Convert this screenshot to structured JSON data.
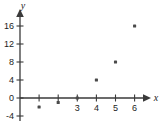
{
  "chart_data": {
    "type": "scatter",
    "title": "",
    "xlabel": "x",
    "ylabel": "y",
    "xlim": [
      -0.35,
      6.6
    ],
    "ylim": [
      -4.6,
      17.8
    ],
    "grid": false,
    "legend": null,
    "x_ticks": [
      1,
      2,
      3,
      4,
      5,
      6
    ],
    "x_tick_labels": [
      "",
      "",
      "3",
      "4",
      "5",
      "6"
    ],
    "y_ticks": [
      -4,
      0,
      4,
      8,
      12,
      16
    ],
    "y_tick_labels": [
      "-4",
      "0",
      "4",
      "8",
      "12",
      "16"
    ],
    "points": [
      {
        "x": 1,
        "y": -2
      },
      {
        "x": 2,
        "y": -1
      },
      {
        "x": 3,
        "y": 0
      },
      {
        "x": 4,
        "y": 4
      },
      {
        "x": 5,
        "y": 8
      },
      {
        "x": 6,
        "y": 16
      }
    ],
    "marker": "square-dot",
    "colors": {
      "background": "#ffffff",
      "axis": "#3a3a3a",
      "marker": "#4a4a4a",
      "text": "#1c1c1c"
    }
  },
  "axes": {
    "x_axis_label": "x",
    "y_axis_label": "y"
  }
}
